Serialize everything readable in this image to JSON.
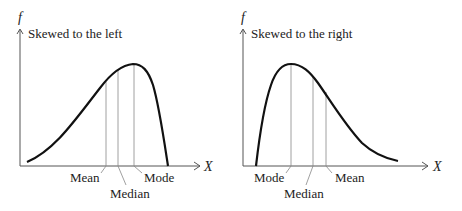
{
  "left_panel": {
    "y_axis_label": "f",
    "x_axis_label": "X",
    "title": "Skewed to the left",
    "markers": {
      "mean": "Mean",
      "median": "Median",
      "mode": "Mode"
    }
  },
  "right_panel": {
    "y_axis_label": "f",
    "x_axis_label": "X",
    "title": "Skewed to the right",
    "markers": {
      "mode": "Mode",
      "median": "Median",
      "mean": "Mean"
    }
  },
  "colors": {
    "curve": "#111111",
    "axis": "#555555",
    "marker_line": "#888888",
    "text": "#222222"
  }
}
